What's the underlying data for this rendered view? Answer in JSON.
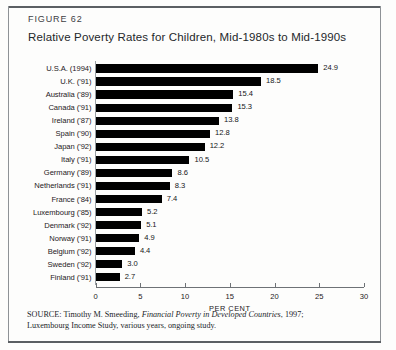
{
  "figure": {
    "number": "FIGURE 62",
    "title": "Relative Poverty Rates for Children, Mid-1980s to Mid-1990s"
  },
  "source": {
    "prefix": "SOURCE: Timothy M. Smeeding, ",
    "italic_title": "Financial Poverty in Developed Countries",
    "suffix": ", 1997;",
    "line2": "Luxembourg Income Study, various years, ongoing study."
  },
  "colors": {
    "bar": "#000000",
    "axis": "#6e7276",
    "rule": "#5b5f63",
    "text": "#1d2023",
    "background": "#fdfdfc"
  },
  "chart_data": {
    "type": "bar",
    "orientation": "horizontal",
    "title": "Relative Poverty Rates for Children, Mid-1980s to Mid-1990s",
    "xlabel": "PER CENT",
    "ylabel": "",
    "xlim": [
      0,
      30
    ],
    "xticks": [
      0,
      5,
      10,
      15,
      20,
      25,
      30
    ],
    "xtick_labels": [
      "0",
      "5",
      "10",
      "15",
      "20",
      "25",
      "30"
    ],
    "grid": false,
    "legend": false,
    "categories": [
      "U.S.A. (1994)",
      "U.K. ('91)",
      "Australia ('89)",
      "Canada ('91)",
      "Ireland ('87)",
      "Spain ('90)",
      "Japan ('92)",
      "Italy ('91)",
      "Germany ('89)",
      "Netherlands ('91)",
      "France ('84)",
      "Luxembourg ('85)",
      "Denmark ('92)",
      "Norway ('91)",
      "Belgium ('92)",
      "Sweden ('92)",
      "Finland ('91)"
    ],
    "values": [
      24.9,
      18.5,
      15.4,
      15.3,
      13.8,
      12.8,
      12.2,
      10.5,
      8.6,
      8.3,
      7.4,
      5.2,
      5.1,
      4.9,
      4.4,
      3.0,
      2.7
    ],
    "value_labels": [
      "24.9",
      "18.5",
      "15.4",
      "15.3",
      "13.8",
      "12.8",
      "12.2",
      "10.5",
      "8.6",
      "8.3",
      "7.4",
      "5.2",
      "5.1",
      "4.9",
      "4.4",
      "3.0",
      "2.7"
    ]
  }
}
